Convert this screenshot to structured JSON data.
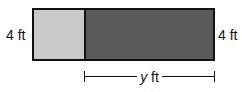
{
  "diagram": {
    "shapes": [
      {
        "name": "light-rectangle",
        "fill": "#c9c9c9"
      },
      {
        "name": "dark-rectangle",
        "fill": "#5a5a5a"
      }
    ],
    "left_label": "4 ft",
    "right_label": "4 ft",
    "dimension": {
      "variable": "y",
      "unit": "ft"
    }
  }
}
